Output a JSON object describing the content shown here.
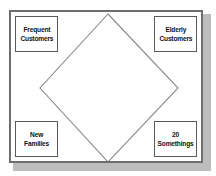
{
  "diagram": {
    "type": "diamond-quadrant",
    "shapes": {
      "center_diamond": {
        "name": "diamond",
        "fill": "#ffffff",
        "stroke": "#8a8a8a",
        "vertices_top": "108,14",
        "vertices_right": "178,88",
        "vertices_bottom": "108,162",
        "vertices_left": "40,88"
      }
    },
    "frame": {
      "border_color": "#6e6e6e",
      "shadow_color": "#bdbdbd",
      "background": "#ffffff"
    },
    "corners": [
      {
        "position": "top-left",
        "label": "Frequent\nCustomers",
        "text_color": "#111111",
        "border_color": "#5a5a5a",
        "background": "#ffffff"
      },
      {
        "position": "top-right",
        "label": "Elderly\nCustomers",
        "text_color": "#111111",
        "border_color": "#5a5a5a",
        "background": "#ffffff"
      },
      {
        "position": "bottom-left",
        "label": "New\nFamilies",
        "text_color": "#111111",
        "border_color": "#5a5a5a",
        "background": "#ffffff"
      },
      {
        "position": "bottom-right",
        "label": "20\nSomethings",
        "text_color": "#111111",
        "border_color": "#5a5a5a",
        "background": "#ffffff"
      }
    ]
  }
}
